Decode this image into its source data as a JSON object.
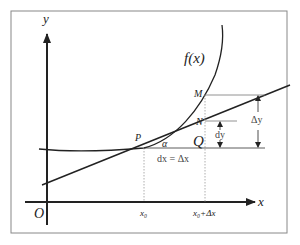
{
  "diagram": {
    "axes": {
      "y_label": "y",
      "x_label": "x",
      "origin_label": "O"
    },
    "curve_label": "f(x)",
    "points": {
      "P": "P",
      "M": "M",
      "N": "N",
      "Q": "Q"
    },
    "angle_label": "α",
    "x_ticks": {
      "x0": "x₀",
      "x0_plus_dx": "x₀+Δx"
    },
    "annotations": {
      "dx_eq": "dx = Δx",
      "dy": "dy",
      "delta_y": "Δy"
    },
    "colors": {
      "stroke": "#222222",
      "guide": "#999999",
      "frame": "#888888"
    }
  }
}
